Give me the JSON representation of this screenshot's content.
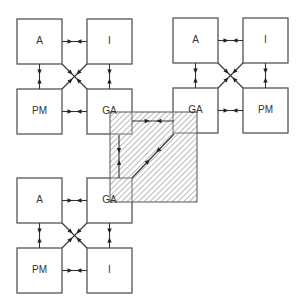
{
  "diagram": {
    "clusters": [
      {
        "id": "top-left",
        "boxes": {
          "tl": "A",
          "tr": "I",
          "bl": "PM",
          "br": "GA"
        }
      },
      {
        "id": "top-right",
        "boxes": {
          "tl": "A",
          "tr": "I",
          "bl": "GA",
          "br": "PM"
        }
      },
      {
        "id": "bottom-left",
        "boxes": {
          "tl": "A",
          "tr": "GA",
          "bl": "PM",
          "br": "I"
        }
      }
    ],
    "shared_region": {
      "description": "hatched overlap connecting the three GA boxes",
      "links": [
        "GA-GA horizontal",
        "GA-GA vertical",
        "GA-GA diagonal"
      ]
    },
    "colors": {
      "line": "#333333",
      "box_border": "#6a6a6a",
      "hatch": "#8a8a8a"
    }
  }
}
